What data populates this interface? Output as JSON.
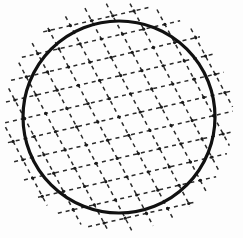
{
  "figure": {
    "title": "Dashed diagonal lattice inscribed in a bold circle",
    "type": "line-drawing",
    "canvas": {
      "width": 243,
      "height": 238,
      "background_color": "#fdfdfd"
    },
    "circle": {
      "label": "circle-outline",
      "center_x": 119,
      "center_y": 117,
      "radius": 96,
      "stroke_color": "#111111",
      "stroke_width": 3.2,
      "fill": "none"
    },
    "lattice": {
      "label": "dashed-diamond-lattice",
      "stroke_color": "#2a2a2a",
      "stroke_width": 1.5,
      "dash_pattern": "4 4",
      "overshoot": 18,
      "families": [
        {
          "name": "shallow-family",
          "angle_degrees": -13,
          "spacing": 20,
          "count": 15,
          "direction": "ascending left-to-right"
        },
        {
          "name": "steep-family",
          "angle_degrees": 62,
          "spacing": 21,
          "count": 15,
          "direction": "descending left-to-right"
        }
      ],
      "node_color": "#1a1a1a",
      "node_radius": 1.6
    },
    "colors": {
      "ink": "#111111",
      "dash_ink": "#2a2a2a",
      "paper": "#fdfdfd"
    }
  }
}
